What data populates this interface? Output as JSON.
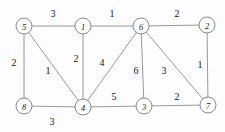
{
  "figure": {
    "background_color": "#fdfdfd",
    "edge_color": "#8d8d8d",
    "node_fill_color": "#ffffff",
    "node_stroke_color": "#7c7c7c",
    "text_color": "#141414"
  },
  "chart_data": {
    "type": "diagram",
    "diagram_kind": "weighted-undirected-graph",
    "title": "",
    "xlabel": "",
    "ylabel": "",
    "node_radius": 8,
    "nodes": [
      {
        "id": "5",
        "label": "5",
        "x": 24,
        "y": 26
      },
      {
        "id": "1",
        "label": "1",
        "x": 83,
        "y": 26
      },
      {
        "id": "6",
        "label": "6",
        "x": 141,
        "y": 26
      },
      {
        "id": "2",
        "label": "2",
        "x": 207,
        "y": 25
      },
      {
        "id": "8",
        "label": "8",
        "x": 24,
        "y": 106
      },
      {
        "id": "4",
        "label": "4",
        "x": 83,
        "y": 107
      },
      {
        "id": "3",
        "label": "3",
        "x": 144,
        "y": 106
      },
      {
        "id": "7",
        "label": "7",
        "x": 208,
        "y": 105
      }
    ],
    "edges": [
      {
        "source": "5",
        "target": "1",
        "weight": 3,
        "label": "3",
        "label_x": 53,
        "label_y": 13
      },
      {
        "source": "1",
        "target": "6",
        "weight": 1,
        "label": "1",
        "label_x": 112,
        "label_y": 13
      },
      {
        "source": "6",
        "target": "2",
        "weight": 2,
        "label": "2",
        "label_x": 177,
        "label_y": 13
      },
      {
        "source": "5",
        "target": "8",
        "weight": 2,
        "label": "2",
        "label_x": 14,
        "label_y": 62
      },
      {
        "source": "5",
        "target": "4",
        "weight": 1,
        "label": "1",
        "label_x": 48,
        "label_y": 70
      },
      {
        "source": "1",
        "target": "4",
        "weight": 2,
        "label": "2",
        "label_x": 76,
        "label_y": 58
      },
      {
        "source": "6",
        "target": "4",
        "weight": 4,
        "label": "4",
        "label_x": 102,
        "label_y": 62
      },
      {
        "source": "6",
        "target": "3",
        "weight": 6,
        "label": "6",
        "label_x": 136,
        "label_y": 70
      },
      {
        "source": "6",
        "target": "7",
        "weight": 3,
        "label": "3",
        "label_x": 164,
        "label_y": 70
      },
      {
        "source": "2",
        "target": "7",
        "weight": 1,
        "label": "1",
        "label_x": 200,
        "label_y": 64
      },
      {
        "source": "8",
        "target": "4",
        "weight": 3,
        "label": "3",
        "label_x": 52,
        "label_y": 121
      },
      {
        "source": "4",
        "target": "3",
        "weight": 5,
        "label": "5",
        "label_x": 114,
        "label_y": 96
      },
      {
        "source": "3",
        "target": "7",
        "weight": 2,
        "label": "2",
        "label_x": 177,
        "label_y": 96
      }
    ]
  }
}
